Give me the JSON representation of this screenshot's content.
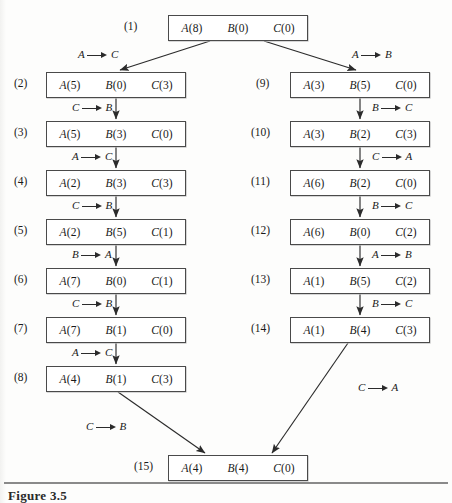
{
  "figure": {
    "caption": "Figure 3.5",
    "caption_x": 8,
    "caption_y": 488,
    "rule_y": 482
  },
  "layout": {
    "box_width": 140,
    "box_height": 26,
    "left_x": 46,
    "right_x": 290,
    "center_x": 168,
    "row_y": [
      15,
      72,
      121,
      170,
      219,
      268,
      317,
      366,
      455
    ]
  },
  "nodes": [
    {
      "id": "1",
      "label": "(1)",
      "x": 168,
      "y": 15,
      "label_x": 124,
      "label_y": 20,
      "cells": [
        "A(8)",
        "B(0)",
        "C(0)"
      ]
    },
    {
      "id": "2",
      "label": "(2)",
      "x": 46,
      "y": 72,
      "label_x": 14,
      "label_y": 77,
      "cells": [
        "A(5)",
        "B(0)",
        "C(3)"
      ]
    },
    {
      "id": "3",
      "label": "(3)",
      "x": 46,
      "y": 121,
      "label_x": 14,
      "label_y": 126,
      "cells": [
        "A(5)",
        "B(3)",
        "C(0)"
      ]
    },
    {
      "id": "4",
      "label": "(4)",
      "x": 46,
      "y": 170,
      "label_x": 14,
      "label_y": 175,
      "cells": [
        "A(2)",
        "B(3)",
        "C(3)"
      ]
    },
    {
      "id": "5",
      "label": "(5)",
      "x": 46,
      "y": 219,
      "label_x": 14,
      "label_y": 224,
      "cells": [
        "A(2)",
        "B(5)",
        "C(1)"
      ]
    },
    {
      "id": "6",
      "label": "(6)",
      "x": 46,
      "y": 268,
      "label_x": 14,
      "label_y": 273,
      "cells": [
        "A(7)",
        "B(0)",
        "C(1)"
      ]
    },
    {
      "id": "7",
      "label": "(7)",
      "x": 46,
      "y": 317,
      "label_x": 14,
      "label_y": 322,
      "cells": [
        "A(7)",
        "B(1)",
        "C(0)"
      ]
    },
    {
      "id": "8",
      "label": "(8)",
      "x": 46,
      "y": 366,
      "label_x": 14,
      "label_y": 371,
      "cells": [
        "A(4)",
        "B(1)",
        "C(3)"
      ]
    },
    {
      "id": "9",
      "label": "(9)",
      "x": 290,
      "y": 72,
      "label_x": 256,
      "label_y": 77,
      "cells": [
        "A(3)",
        "B(5)",
        "C(0)"
      ]
    },
    {
      "id": "10",
      "label": "(10)",
      "x": 290,
      "y": 121,
      "label_x": 251,
      "label_y": 126,
      "cells": [
        "A(3)",
        "B(2)",
        "C(3)"
      ]
    },
    {
      "id": "11",
      "label": "(11)",
      "x": 290,
      "y": 170,
      "label_x": 251,
      "label_y": 175,
      "cells": [
        "A(6)",
        "B(2)",
        "C(0)"
      ]
    },
    {
      "id": "12",
      "label": "(12)",
      "x": 290,
      "y": 219,
      "label_x": 251,
      "label_y": 224,
      "cells": [
        "A(6)",
        "B(0)",
        "C(2)"
      ]
    },
    {
      "id": "13",
      "label": "(13)",
      "x": 290,
      "y": 268,
      "label_x": 251,
      "label_y": 273,
      "cells": [
        "A(1)",
        "B(5)",
        "C(2)"
      ]
    },
    {
      "id": "14",
      "label": "(14)",
      "x": 290,
      "y": 317,
      "label_x": 251,
      "label_y": 322,
      "cells": [
        "A(1)",
        "B(4)",
        "C(3)"
      ]
    },
    {
      "id": "15",
      "label": "(15)",
      "x": 168,
      "y": 455,
      "label_x": 134,
      "label_y": 460,
      "cells": [
        "A(4)",
        "B(4)",
        "C(0)"
      ]
    }
  ],
  "transitions": [
    {
      "id": "t1-2",
      "from": "1",
      "to": "2",
      "from_token": "A",
      "to_token": "C",
      "x": 78,
      "y": 48
    },
    {
      "id": "t1-9",
      "from": "1",
      "to": "9",
      "from_token": "A",
      "to_token": "B",
      "x": 352,
      "y": 48
    },
    {
      "id": "t2-3",
      "from": "2",
      "to": "3",
      "from_token": "C",
      "to_token": "B",
      "x": 72,
      "y": 101
    },
    {
      "id": "t3-4",
      "from": "3",
      "to": "4",
      "from_token": "A",
      "to_token": "C",
      "x": 72,
      "y": 150
    },
    {
      "id": "t4-5",
      "from": "4",
      "to": "5",
      "from_token": "C",
      "to_token": "B",
      "x": 72,
      "y": 199
    },
    {
      "id": "t5-6",
      "from": "5",
      "to": "6",
      "from_token": "B",
      "to_token": "A",
      "x": 72,
      "y": 248
    },
    {
      "id": "t6-7",
      "from": "6",
      "to": "7",
      "from_token": "C",
      "to_token": "B",
      "x": 72,
      "y": 297
    },
    {
      "id": "t7-8",
      "from": "7",
      "to": "8",
      "from_token": "A",
      "to_token": "C",
      "x": 72,
      "y": 346
    },
    {
      "id": "t8-15",
      "from": "8",
      "to": "15",
      "from_token": "C",
      "to_token": "B",
      "x": 86,
      "y": 420
    },
    {
      "id": "t9-10",
      "from": "9",
      "to": "10",
      "from_token": "B",
      "to_token": "C",
      "x": 372,
      "y": 101
    },
    {
      "id": "t10-11",
      "from": "10",
      "to": "11",
      "from_token": "C",
      "to_token": "A",
      "x": 372,
      "y": 150
    },
    {
      "id": "t11-12",
      "from": "11",
      "to": "12",
      "from_token": "B",
      "to_token": "C",
      "x": 372,
      "y": 199
    },
    {
      "id": "t12-13",
      "from": "12",
      "to": "13",
      "from_token": "A",
      "to_token": "B",
      "x": 372,
      "y": 248
    },
    {
      "id": "t13-14",
      "from": "13",
      "to": "14",
      "from_token": "B",
      "to_token": "C",
      "x": 372,
      "y": 297
    },
    {
      "id": "t14-15",
      "from": "14",
      "to": "15",
      "from_token": "C",
      "to_token": "A",
      "x": 358,
      "y": 381
    }
  ],
  "edges": [
    {
      "id": "e1-2",
      "x1": 210,
      "y1": 41,
      "x2": 120,
      "y2": 70,
      "kind": "diagonal"
    },
    {
      "id": "e1-9",
      "x1": 264,
      "y1": 41,
      "x2": 356,
      "y2": 70,
      "kind": "diagonal"
    },
    {
      "id": "e2-3",
      "x1": 116,
      "y1": 98,
      "x2": 116,
      "y2": 119,
      "kind": "vertical"
    },
    {
      "id": "e3-4",
      "x1": 116,
      "y1": 147,
      "x2": 116,
      "y2": 168,
      "kind": "vertical"
    },
    {
      "id": "e4-5",
      "x1": 116,
      "y1": 196,
      "x2": 116,
      "y2": 217,
      "kind": "vertical"
    },
    {
      "id": "e5-6",
      "x1": 116,
      "y1": 245,
      "x2": 116,
      "y2": 266,
      "kind": "vertical"
    },
    {
      "id": "e6-7",
      "x1": 116,
      "y1": 294,
      "x2": 116,
      "y2": 315,
      "kind": "vertical"
    },
    {
      "id": "e7-8",
      "x1": 116,
      "y1": 343,
      "x2": 116,
      "y2": 364,
      "kind": "vertical"
    },
    {
      "id": "e8-15",
      "x1": 118,
      "y1": 392,
      "x2": 205,
      "y2": 453,
      "kind": "diagonal"
    },
    {
      "id": "e9-10",
      "x1": 360,
      "y1": 98,
      "x2": 360,
      "y2": 119,
      "kind": "vertical"
    },
    {
      "id": "e10-11",
      "x1": 360,
      "y1": 147,
      "x2": 360,
      "y2": 168,
      "kind": "vertical"
    },
    {
      "id": "e11-12",
      "x1": 360,
      "y1": 196,
      "x2": 360,
      "y2": 217,
      "kind": "vertical"
    },
    {
      "id": "e12-13",
      "x1": 360,
      "y1": 245,
      "x2": 360,
      "y2": 266,
      "kind": "vertical"
    },
    {
      "id": "e13-14",
      "x1": 360,
      "y1": 294,
      "x2": 360,
      "y2": 315,
      "kind": "vertical"
    },
    {
      "id": "e14-15",
      "x1": 348,
      "y1": 343,
      "x2": 272,
      "y2": 453,
      "kind": "diagonal"
    }
  ],
  "colors": {
    "page_background": "#fdfdfc",
    "box_border": "#4a4a4a",
    "box_fill": "#ffffff",
    "edge_stroke": "#2b2b2b",
    "text": "#1a1a1a",
    "rule": "#8a8a8a"
  }
}
